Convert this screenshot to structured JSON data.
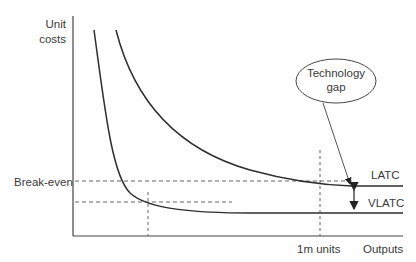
{
  "diagram": {
    "y_axis_label_line1": "Unit",
    "y_axis_label_line2": "costs",
    "x_axis_label": "Outputs",
    "break_even_label": "Break-even",
    "x_marker_label": "1m units",
    "curves": [
      {
        "name": "LATC",
        "label": "LATC"
      },
      {
        "name": "VLATC",
        "label": "VLATC"
      }
    ],
    "callout_line1": "Technology",
    "callout_line2": "gap",
    "colors": {
      "line": "#333333",
      "text": "#3a3a3a",
      "background": "#ffffff"
    }
  }
}
